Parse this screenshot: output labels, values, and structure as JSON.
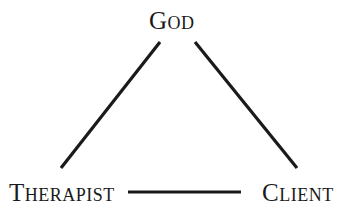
{
  "diagram": {
    "type": "triangle",
    "nodes": [
      {
        "id": "god",
        "label": "God"
      },
      {
        "id": "therapist",
        "label": "Therapist"
      },
      {
        "id": "client",
        "label": "Client"
      }
    ],
    "edges": [
      {
        "from": "god",
        "to": "therapist"
      },
      {
        "from": "god",
        "to": "client"
      },
      {
        "from": "therapist",
        "to": "client"
      }
    ],
    "colors": {
      "line": "#1a1a1a",
      "text": "#1a1a1a",
      "background": "#ffffff"
    }
  }
}
